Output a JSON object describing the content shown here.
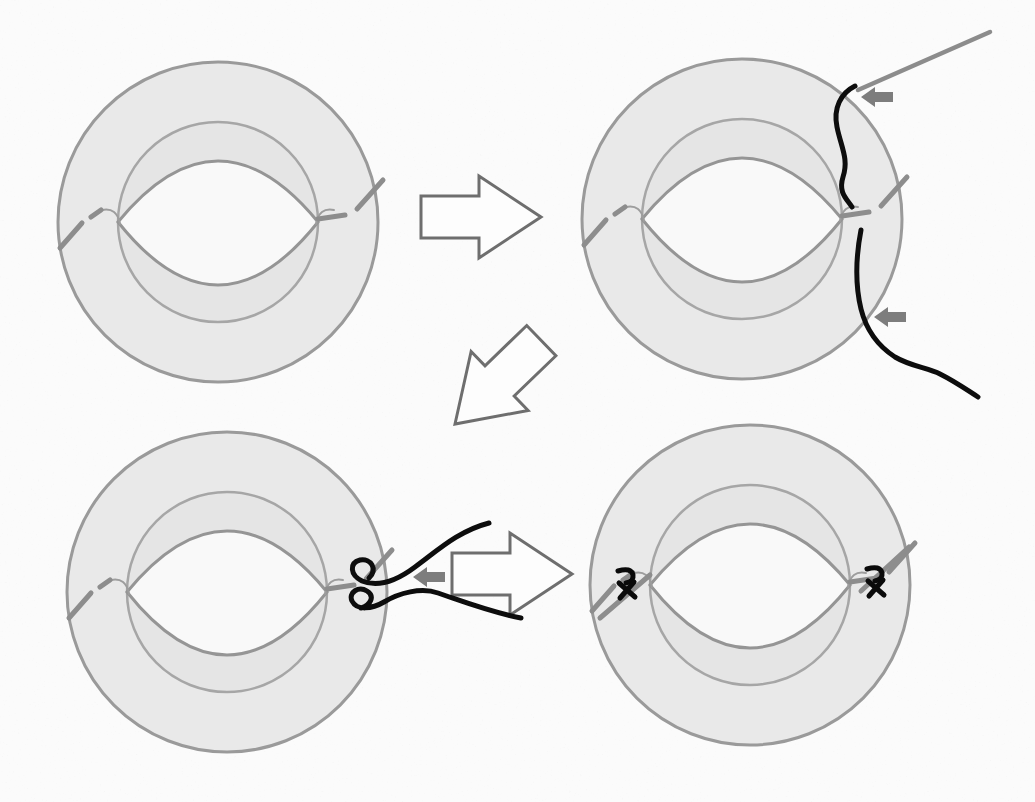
{
  "figure": {
    "kind": "eye-surgery-technique-diagram",
    "panel_count": 4,
    "steps": [
      {
        "id": 1,
        "position": "top-left",
        "name": "eye-with-lens-and-dashed-haptic"
      },
      {
        "id": 2,
        "position": "top-right",
        "name": "needle-passes-suture-around-haptic",
        "elements": [
          "needle",
          "suture-thread-upper",
          "suture-thread-lower",
          "pointer-arrow",
          "pointer-arrow"
        ]
      },
      {
        "id": 3,
        "position": "bottom-left",
        "name": "suture-ends-externalized-and-crossed",
        "elements": [
          "crossed-suture-loops",
          "pointer-arrow"
        ]
      },
      {
        "id": 4,
        "position": "bottom-right",
        "name": "knots-tied-on-both-sides",
        "elements": [
          "suture-knot-left",
          "suture-knot-right"
        ]
      }
    ],
    "flow_arrows": [
      {
        "from": 1,
        "to": 2,
        "direction": "right"
      },
      {
        "from": 2,
        "to": 3,
        "direction": "down-left"
      },
      {
        "from": 3,
        "to": 4,
        "direction": "right"
      }
    ],
    "icons": [
      "pointer-arrow-icon",
      "flow-arrow-icon",
      "needle-icon",
      "knot-icon"
    ]
  },
  "colors": {
    "background": "#fbfbfb",
    "sclera_fill": "#e9e9e9",
    "sclera_stroke": "#9a9a9a",
    "iris_fill": "#e5e5e5",
    "iris_stroke": "#a6a6a6",
    "lens_fill": "#f9f9f9",
    "lens_stroke": "#959595",
    "haptic": "#8d8d8d",
    "hook": "#9d9d9d",
    "needle": "#8c8c8c",
    "thread": "#0d0d0d",
    "flow_arrow_stroke": "#6e6e6e",
    "flow_arrow_fill": "#fdfdfd",
    "block_arrow": "#7d7d7d",
    "knot": "#0a0a0a"
  }
}
